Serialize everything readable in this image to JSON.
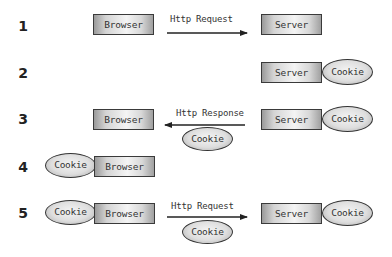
{
  "steps": [
    {
      "number": "1",
      "left_browser": "Browser",
      "arrow_label": "Http Request",
      "arrow_direction": "right",
      "right_server": "Server"
    },
    {
      "number": "2",
      "right_server": "Server",
      "server_cookie": "Cookie"
    },
    {
      "number": "3",
      "left_browser": "Browser",
      "arrow_label": "Http Response",
      "arrow_direction": "left",
      "arrow_cookie": "Cookie",
      "right_server": "Server",
      "server_cookie": "Cookie"
    },
    {
      "number": "4",
      "browser_cookie": "Cookie",
      "left_browser": "Browser"
    },
    {
      "number": "5",
      "browser_cookie": "Cookie",
      "left_browser": "Browser",
      "arrow_label": "Http Request",
      "arrow_direction": "right",
      "arrow_cookie": "Cookie",
      "right_server": "Server",
      "server_cookie": "Cookie"
    }
  ],
  "colors": {
    "border": "#333333",
    "text": "#333333",
    "background": "#ffffff"
  }
}
